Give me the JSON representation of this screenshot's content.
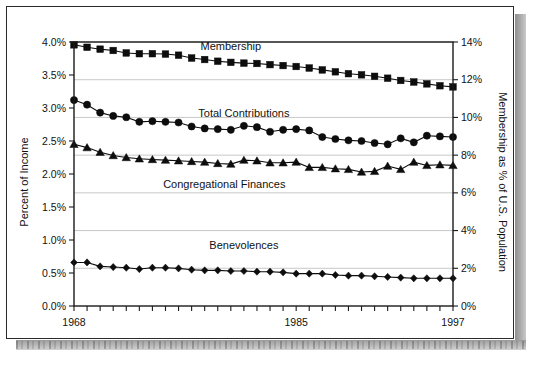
{
  "document": {
    "kind": "scanned-page-figure"
  },
  "chart_data": {
    "type": "line",
    "title": "",
    "xlabel": "",
    "ylabel": "Percent of Income",
    "y2label": "Membership as % of U.S. Population",
    "grid": true,
    "legend_position": "inline-annotations",
    "xlim": [
      1968,
      1997
    ],
    "ylim": [
      0.0,
      4.0
    ],
    "y2lim": [
      0,
      14
    ],
    "x": [
      1968,
      1969,
      1970,
      1971,
      1972,
      1973,
      1974,
      1975,
      1976,
      1977,
      1978,
      1979,
      1980,
      1981,
      1982,
      1983,
      1984,
      1985,
      1986,
      1987,
      1988,
      1989,
      1990,
      1991,
      1992,
      1993,
      1994,
      1995,
      1996,
      1997
    ],
    "xticklabels": [
      "1968",
      "1985",
      "1997"
    ],
    "xtickvalues": [
      1968,
      1985,
      1997
    ],
    "yticklabels": [
      "0.0%",
      "0.5%",
      "1.0%",
      "1.5%",
      "2.0%",
      "2.5%",
      "3.0%",
      "3.5%",
      "4.0%"
    ],
    "ytickvalues": [
      0.0,
      0.5,
      1.0,
      1.5,
      2.0,
      2.5,
      3.0,
      3.5,
      4.0
    ],
    "y2ticklabels": [
      "0%",
      "2%",
      "4%",
      "6%",
      "8%",
      "10%",
      "12%",
      "14%"
    ],
    "y2tickvalues": [
      0,
      2,
      4,
      6,
      8,
      10,
      12,
      14
    ],
    "series": [
      {
        "name": "Membership",
        "axis": "right",
        "marker": "square",
        "label_x": 1980.0,
        "label_y": 13.55,
        "values": [
          13.85,
          13.72,
          13.62,
          13.55,
          13.42,
          13.38,
          13.38,
          13.36,
          13.3,
          13.15,
          13.07,
          12.98,
          12.92,
          12.88,
          12.86,
          12.8,
          12.75,
          12.7,
          12.62,
          12.52,
          12.42,
          12.32,
          12.26,
          12.18,
          12.08,
          11.96,
          11.88,
          11.78,
          11.68,
          11.62
        ]
      },
      {
        "name": "Total Contributions",
        "axis": "left",
        "marker": "circle",
        "label_x": 1981.0,
        "label_y": 2.86,
        "values": [
          3.12,
          3.05,
          2.93,
          2.88,
          2.86,
          2.79,
          2.8,
          2.79,
          2.78,
          2.72,
          2.69,
          2.68,
          2.67,
          2.73,
          2.71,
          2.64,
          2.67,
          2.68,
          2.66,
          2.56,
          2.53,
          2.51,
          2.5,
          2.47,
          2.45,
          2.54,
          2.48,
          2.58,
          2.57,
          2.56
        ]
      },
      {
        "name": "Congregational Finances",
        "axis": "left",
        "marker": "triangle",
        "label_x": 1979.5,
        "label_y": 1.79,
        "values": [
          2.45,
          2.4,
          2.33,
          2.28,
          2.25,
          2.23,
          2.22,
          2.21,
          2.2,
          2.19,
          2.18,
          2.16,
          2.15,
          2.21,
          2.2,
          2.17,
          2.17,
          2.18,
          2.1,
          2.1,
          2.08,
          2.07,
          2.03,
          2.04,
          2.12,
          2.07,
          2.18,
          2.13,
          2.14,
          2.13
        ]
      },
      {
        "name": "Benevolences",
        "axis": "left",
        "marker": "diamond",
        "label_x": 1981.0,
        "label_y": 0.86,
        "values": [
          0.66,
          0.66,
          0.6,
          0.59,
          0.58,
          0.56,
          0.58,
          0.58,
          0.57,
          0.55,
          0.54,
          0.54,
          0.53,
          0.53,
          0.52,
          0.52,
          0.51,
          0.49,
          0.49,
          0.49,
          0.47,
          0.46,
          0.46,
          0.45,
          0.44,
          0.43,
          0.42,
          0.42,
          0.42,
          0.42
        ]
      }
    ]
  },
  "colors": {
    "ink": "#0d0d0d",
    "grid": "#b9b9b9",
    "paper": "#ffffff"
  }
}
